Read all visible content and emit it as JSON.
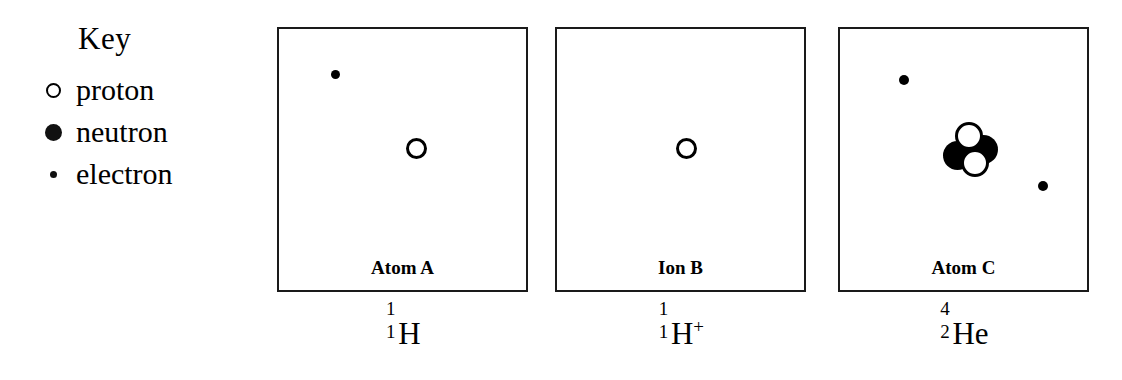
{
  "key": {
    "title": "Key",
    "items": [
      {
        "symbol": "proton-symbol",
        "label": "proton"
      },
      {
        "symbol": "neutron-symbol",
        "label": "neutron"
      },
      {
        "symbol": "electron-symbol",
        "label": "electron"
      }
    ]
  },
  "colors": {
    "ink": "#000000",
    "background": "#ffffff",
    "border": "#1a1a1a"
  },
  "diagrams": [
    {
      "caption": "Atom A",
      "formula": {
        "mass_number": "1",
        "atomic_number": "1",
        "element": "H",
        "charge": ""
      },
      "particles": [
        {
          "type": "electron",
          "x": 56,
          "y": 45,
          "size": 9
        },
        {
          "type": "proton",
          "x": 137,
          "y": 119,
          "size": 21
        }
      ]
    },
    {
      "caption": "Ion B",
      "formula": {
        "mass_number": "1",
        "atomic_number": "1",
        "element": "H",
        "charge": "+"
      },
      "particles": [
        {
          "type": "proton",
          "x": 129,
          "y": 119,
          "size": 21
        }
      ]
    },
    {
      "caption": "Atom C",
      "formula": {
        "mass_number": "4",
        "atomic_number": "2",
        "element": "He",
        "charge": ""
      },
      "particles": [
        {
          "type": "electron",
          "x": 64,
          "y": 51,
          "size": 10
        },
        {
          "type": "neutron",
          "x": 117,
          "y": 126,
          "size": 29
        },
        {
          "type": "neutron",
          "x": 143,
          "y": 120,
          "size": 29
        },
        {
          "type": "proton",
          "x": 129,
          "y": 107,
          "size": 28
        },
        {
          "type": "proton",
          "x": 135,
          "y": 134,
          "size": 28
        },
        {
          "type": "electron",
          "x": 203,
          "y": 157,
          "size": 10
        }
      ]
    }
  ]
}
